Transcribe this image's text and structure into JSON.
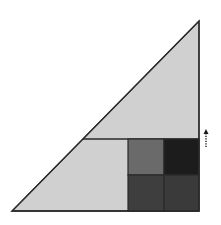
{
  "diagram": {
    "type": "geometric-dissection",
    "colors": {
      "background": "#ffffff",
      "triangle_fill": "#d0d0d0",
      "outline": "#2a2a2a",
      "square_top_left": "#6a6a6a",
      "square_top_right": "#1c1c1c",
      "square_bottom_left": "#3e3e3e",
      "square_bottom_right": "#3a3a3a",
      "arrow": "#1a1a1a"
    },
    "triangle": {
      "points": [
        [
          12,
          211
        ],
        [
          199,
          211
        ],
        [
          199,
          21
        ]
      ]
    },
    "divider_line": {
      "x1": 83,
      "y1": 139,
      "x2": 199,
      "y2": 139
    },
    "squares": [
      {
        "name": "top-left",
        "x": 128,
        "y": 139,
        "w": 36,
        "h": 36
      },
      {
        "name": "top-right",
        "x": 164,
        "y": 139,
        "w": 35,
        "h": 36
      },
      {
        "name": "bottom-left",
        "x": 128,
        "y": 175,
        "w": 36,
        "h": 36
      },
      {
        "name": "bottom-right",
        "x": 164,
        "y": 175,
        "w": 35,
        "h": 36
      }
    ],
    "arrow": {
      "x": 206,
      "y_tail": 147,
      "y_head": 129,
      "direction": "up",
      "style": "dotted"
    }
  }
}
